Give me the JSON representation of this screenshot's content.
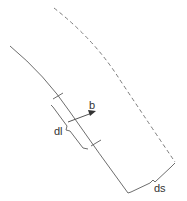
{
  "diagram": {
    "labels": {
      "arrow": "b",
      "segment": "dl",
      "separation": "ds"
    },
    "colors": {
      "line": "#6e6e6e",
      "text": "#333333",
      "background": "#ffffff"
    },
    "elements": [
      {
        "id": "solid-curve",
        "style": "solid"
      },
      {
        "id": "dashed-curve",
        "style": "dashed"
      },
      {
        "id": "segment-brace",
        "label": "dl"
      },
      {
        "id": "normal-arrow",
        "label": "b"
      },
      {
        "id": "separation-brace",
        "label": "ds"
      }
    ]
  }
}
